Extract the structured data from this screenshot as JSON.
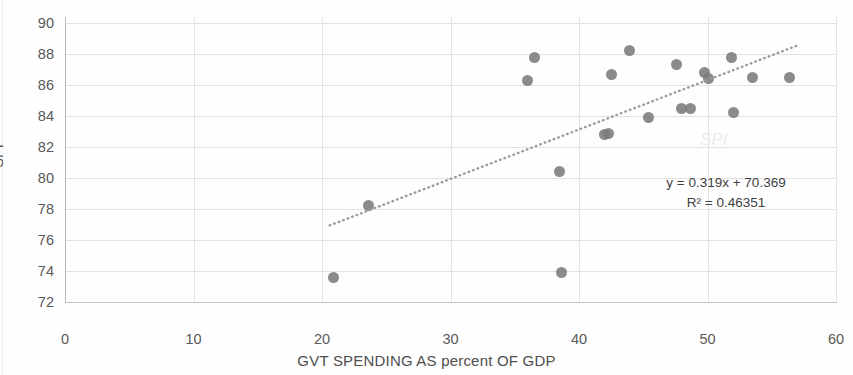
{
  "chart_data": {
    "type": "scatter",
    "title": "",
    "xlabel": "GVT SPENDING AS  percent OF GDP",
    "ylabel": "SPI",
    "xlim": [
      0,
      60
    ],
    "ylim": [
      72,
      90
    ],
    "x_ticks": [
      0,
      10,
      20,
      30,
      40,
      50,
      60
    ],
    "y_ticks": [
      72,
      74,
      76,
      78,
      80,
      82,
      84,
      86,
      88,
      90
    ],
    "grid": true,
    "legend": "none",
    "marker_color": "#7b7b7b",
    "points": [
      {
        "x": 20.9,
        "y": 73.6
      },
      {
        "x": 23.6,
        "y": 78.2
      },
      {
        "x": 36.0,
        "y": 86.3
      },
      {
        "x": 36.5,
        "y": 87.8
      },
      {
        "x": 38.5,
        "y": 80.4
      },
      {
        "x": 38.6,
        "y": 73.9
      },
      {
        "x": 42.0,
        "y": 82.8
      },
      {
        "x": 42.3,
        "y": 82.9
      },
      {
        "x": 42.5,
        "y": 86.7
      },
      {
        "x": 43.9,
        "y": 88.2
      },
      {
        "x": 45.4,
        "y": 83.9
      },
      {
        "x": 47.6,
        "y": 87.3
      },
      {
        "x": 48.0,
        "y": 84.5
      },
      {
        "x": 48.7,
        "y": 84.5
      },
      {
        "x": 49.8,
        "y": 86.8
      },
      {
        "x": 50.1,
        "y": 86.4
      },
      {
        "x": 51.9,
        "y": 87.8
      },
      {
        "x": 52.0,
        "y": 84.2
      },
      {
        "x": 53.5,
        "y": 86.5
      },
      {
        "x": 56.4,
        "y": 86.5
      }
    ],
    "trendline": {
      "style": "dotted",
      "color": "#9a9a9a",
      "equation": "y = 0.319x + 70.369",
      "r_squared_label": "R² = 0.46351",
      "slope": 0.319,
      "intercept": 70.369,
      "r_squared": 0.46351,
      "x_start": 20.6,
      "x_end": 57.2
    },
    "annotations": [
      {
        "name": "equation-label",
        "text": "y = 0.319x + 70.369"
      },
      {
        "name": "r-squared-label",
        "text": "R² = 0.46351"
      }
    ],
    "watermark": "SPI"
  }
}
